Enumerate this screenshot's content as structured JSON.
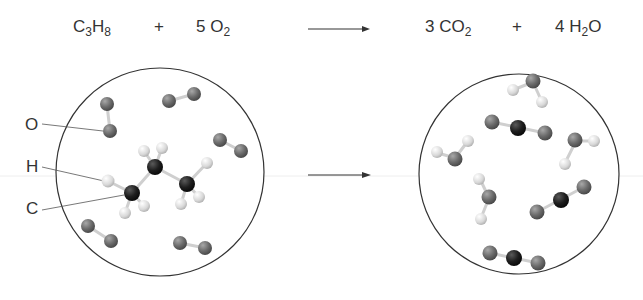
{
  "equation": {
    "reactant1": {
      "coef": "",
      "parts": [
        "C",
        "3",
        "H",
        "8"
      ]
    },
    "plus1": "+",
    "reactant2": {
      "coef": "5",
      "parts": [
        "O",
        "2"
      ]
    },
    "arrow": "→",
    "product1": {
      "coef": "3",
      "parts": [
        "CO",
        "2"
      ]
    },
    "plus2": "+",
    "product2": {
      "coef": "4",
      "parts": [
        "H",
        "2",
        "O"
      ]
    }
  },
  "labels": {
    "oxygen": "O",
    "hydrogen": "H",
    "carbon": "C"
  },
  "colors": {
    "oxygen": "#6b6b6b",
    "hydrogen": "#d8d8d8",
    "carbon": "#1e1e1e",
    "bond": "#cfcfcf",
    "circle": "#333333"
  },
  "reactants_panel": {
    "molecules": [
      "O2",
      "O2",
      "O2",
      "O2",
      "O2",
      "C3H8"
    ]
  },
  "products_panel": {
    "molecules": [
      "H2O",
      "CO2",
      "H2O",
      "H2O",
      "H2O",
      "CO2",
      "CO2"
    ]
  }
}
